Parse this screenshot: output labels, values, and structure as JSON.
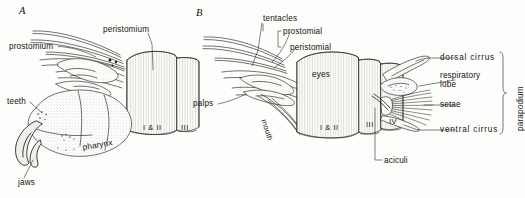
{
  "figure": {
    "background_color": "#fdfdfb",
    "ink_color": "#16130f",
    "panels": [
      {
        "letter": "A",
        "description": "lateral view with everted pharynx"
      },
      {
        "letter": "B",
        "description": "dorsal view with parapodium detail"
      }
    ]
  },
  "panel_a": {
    "letter": "A",
    "labels": {
      "prostomium": "prostomium",
      "peristomium": "peristomium",
      "teeth": "teeth",
      "jaws": "jaws",
      "pharynx": "pharynx"
    },
    "segments": {
      "first": "I & II",
      "second": "III"
    }
  },
  "panel_b": {
    "letter": "B",
    "labels": {
      "tentacles": "tentacles",
      "prostomial": "prostomial",
      "peristomial": "peristomial",
      "palps": "palps",
      "eyes": "eyes",
      "mouth": "mouth",
      "aciculi": "aciculi"
    },
    "segments": {
      "first": "I & II",
      "second": "III",
      "third": "IV"
    },
    "parapodium": {
      "bracket_label": "parapodium",
      "parts": [
        "dorsal  cirrus",
        "respiratory",
        "lobe",
        "setae",
        "ventral  cirrus"
      ],
      "dorsal_cirrus": "dorsal  cirrus",
      "respiratory_line1": "respiratory",
      "respiratory_line2": "lobe",
      "setae": "setae",
      "ventral_cirrus": "ventral  cirrus"
    }
  }
}
